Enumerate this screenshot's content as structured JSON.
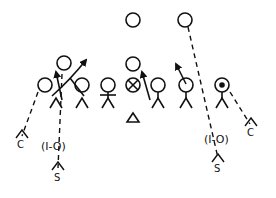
{
  "diagram": {
    "type": "football-defensive-formation",
    "colors": {
      "ink": "#111111",
      "background": "#ffffff"
    },
    "offense": {
      "deep_backs": [
        {
          "id": "back-left",
          "x": 133,
          "y": 20
        },
        {
          "id": "back-right",
          "x": 185,
          "y": 20
        }
      ],
      "center_stack": {
        "id": "qb",
        "x": 133,
        "y": 64
      },
      "center": {
        "id": "center-x",
        "x": 133,
        "y": 85,
        "symbol": "circle-x"
      },
      "line": [
        {
          "id": "ol-1",
          "x": 45,
          "y": 85
        },
        {
          "id": "ol-2",
          "x": 82,
          "y": 85
        },
        {
          "id": "ol-3",
          "x": 108,
          "y": 85
        },
        {
          "id": "ol-4",
          "x": 158,
          "y": 85
        },
        {
          "id": "ol-5",
          "x": 186,
          "y": 85
        },
        {
          "id": "ol-6",
          "x": 222,
          "y": 85,
          "dot": true
        }
      ],
      "backfield_left": {
        "id": "wing-left",
        "x": 64,
        "y": 63
      }
    },
    "defense": {
      "nose": {
        "symbol": "triangle",
        "x": 133,
        "y": 118
      },
      "corners": [
        {
          "label": "C",
          "x": 22,
          "y": 145
        },
        {
          "label": "C",
          "x": 251,
          "y": 132
        }
      ],
      "safeties": [
        {
          "label": "S",
          "x": 58,
          "y": 177
        },
        {
          "label": "S",
          "x": 218,
          "y": 168
        }
      ],
      "technique_labels": [
        {
          "text": "(I-O)",
          "x": 55,
          "y": 146
        },
        {
          "text": "(I-O)",
          "x": 220,
          "y": 139
        }
      ]
    }
  }
}
